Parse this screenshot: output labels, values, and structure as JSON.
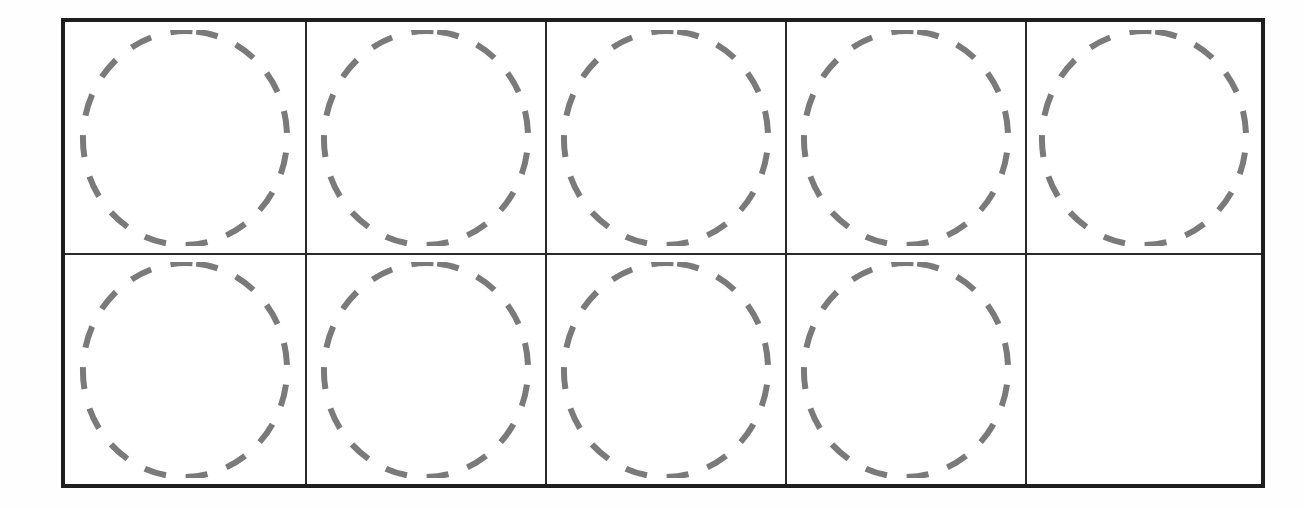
{
  "worksheet": {
    "type": "ten-frame",
    "columns": 5,
    "rows": 2,
    "counter_style": "dashed-circle",
    "counter_color": "#7a7a7a",
    "border_color": "#1e1e1e",
    "filled_count": 9,
    "empty_count": 1,
    "cells": [
      {
        "row": 1,
        "col": 1,
        "filled": true
      },
      {
        "row": 1,
        "col": 2,
        "filled": true
      },
      {
        "row": 1,
        "col": 3,
        "filled": true
      },
      {
        "row": 1,
        "col": 4,
        "filled": true
      },
      {
        "row": 1,
        "col": 5,
        "filled": true
      },
      {
        "row": 2,
        "col": 1,
        "filled": true
      },
      {
        "row": 2,
        "col": 2,
        "filled": true
      },
      {
        "row": 2,
        "col": 3,
        "filled": true
      },
      {
        "row": 2,
        "col": 4,
        "filled": true
      },
      {
        "row": 2,
        "col": 5,
        "filled": false
      }
    ]
  }
}
